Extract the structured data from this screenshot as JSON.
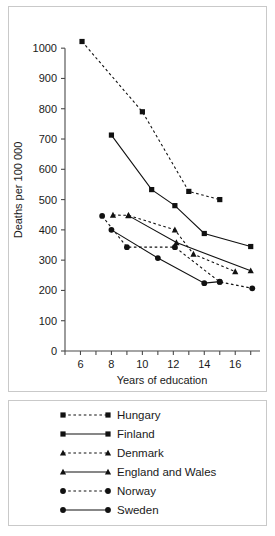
{
  "chart_data": {
    "type": "line",
    "title": "",
    "xlabel": "Years of education",
    "ylabel": "Deaths per 100 000",
    "xlim": [
      5,
      17.6
    ],
    "ylim": [
      0,
      1060
    ],
    "grid": false,
    "legend_position": "below",
    "x_ticks": [
      6,
      8,
      10,
      12,
      14,
      16
    ],
    "x_tick_labels": [
      "6",
      "8",
      "10",
      "12",
      "14",
      "16"
    ],
    "x_minor_ticks": [
      5,
      7,
      9,
      11,
      13,
      15,
      17
    ],
    "y_ticks": [
      0,
      100,
      200,
      300,
      400,
      500,
      600,
      700,
      800,
      900,
      1000
    ],
    "y_tick_labels": [
      "0",
      "100",
      "200",
      "300",
      "400",
      "500",
      "600",
      "700",
      "800",
      "900",
      "1000"
    ],
    "series": [
      {
        "name": "Hungary",
        "line_style": "dashed",
        "marker": "square",
        "points": [
          [
            6.1,
            1022
          ],
          [
            10.0,
            790
          ],
          [
            13.0,
            527
          ],
          [
            15.0,
            500
          ]
        ]
      },
      {
        "name": "Finland",
        "line_style": "solid",
        "marker": "square",
        "points": [
          [
            8.0,
            713
          ],
          [
            10.6,
            533
          ],
          [
            12.1,
            480
          ],
          [
            14.0,
            388
          ],
          [
            17.0,
            345
          ]
        ]
      },
      {
        "name": "Denmark",
        "line_style": "dashed",
        "marker": "triangle",
        "points": [
          [
            8.1,
            449
          ],
          [
            9.1,
            448
          ],
          [
            12.1,
            400
          ],
          [
            13.3,
            320
          ],
          [
            16.0,
            262
          ]
        ]
      },
      {
        "name": "England and Wales",
        "line_style": "solid",
        "marker": "triangle",
        "points": [
          [
            9.1,
            447
          ],
          [
            12.2,
            358
          ],
          [
            17.0,
            265
          ]
        ]
      },
      {
        "name": "Norway",
        "line_style": "dashed",
        "marker": "circle",
        "points": [
          [
            7.4,
            446
          ],
          [
            9.0,
            343
          ],
          [
            12.1,
            343
          ],
          [
            15.0,
            228
          ],
          [
            17.1,
            207
          ]
        ]
      },
      {
        "name": "Sweden",
        "line_style": "solid",
        "marker": "circle",
        "points": [
          [
            8.0,
            400
          ],
          [
            11.0,
            307
          ],
          [
            14.0,
            224
          ],
          [
            15.0,
            229
          ]
        ]
      }
    ],
    "legend_entries": [
      {
        "label": "Hungary",
        "line_style": "dashed",
        "marker": "square"
      },
      {
        "label": "Finland",
        "line_style": "solid",
        "marker": "square"
      },
      {
        "label": "Denmark",
        "line_style": "dashed",
        "marker": "triangle"
      },
      {
        "label": "England and Wales",
        "line_style": "solid",
        "marker": "triangle"
      },
      {
        "label": "Norway",
        "line_style": "dashed",
        "marker": "circle"
      },
      {
        "label": "Sweden",
        "line_style": "solid",
        "marker": "circle"
      }
    ],
    "colors": {
      "line": "#111111",
      "marker": "#111111",
      "axis": "#4a4a4a",
      "text": "#1a1a1a",
      "background": "#ffffff",
      "frame_border": "#c9c9c9"
    }
  }
}
